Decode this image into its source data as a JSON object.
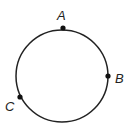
{
  "diagram": {
    "type": "circle-with-points",
    "circle": {
      "cx": 62,
      "cy": 76,
      "r": 46,
      "stroke": "#222222"
    },
    "points": [
      {
        "label": "A",
        "x": 63,
        "y": 28,
        "lx": 57,
        "ly": 20
      },
      {
        "label": "B",
        "x": 108,
        "y": 76,
        "lx": 115,
        "ly": 83
      },
      {
        "label": "C",
        "x": 20,
        "y": 97,
        "lx": 5,
        "ly": 111
      }
    ]
  }
}
